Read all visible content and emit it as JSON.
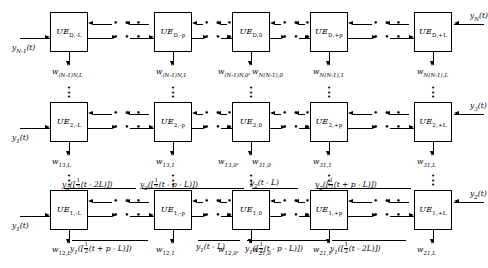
{
  "diagram": {
    "rows": [
      {
        "id": "row-D",
        "boxes": [
          {
            "name": "UE",
            "sub": "D,-L"
          },
          {
            "name": "UE",
            "sub": "D,-p"
          },
          {
            "name": "UE",
            "sub": "D,0"
          },
          {
            "name": "UE",
            "sub": "D,+p"
          },
          {
            "name": "UE",
            "sub": "D,+L"
          }
        ],
        "left_input": "y_{N-1}(t)",
        "left_input_parts": {
          "base": "y",
          "sub": "N-1",
          "tail": "(t)"
        },
        "right_input_parts": {
          "base": "y",
          "sub": "N",
          "tail": "(t)"
        },
        "weights": [
          {
            "base": "w",
            "sub": "(N-1)N,L"
          },
          {
            "base": "w",
            "sub": "(N-1)N,1"
          },
          {
            "base": "w",
            "sub": "(N-1)N,0"
          },
          {
            "base": "w",
            "sub": "N(N-1),0"
          },
          {
            "base": "w",
            "sub": "N(N-1),1"
          },
          {
            "base": "w",
            "sub": "N(N-1),L"
          }
        ]
      },
      {
        "id": "row-2",
        "boxes": [
          {
            "name": "UE",
            "sub": "2,-L"
          },
          {
            "name": "UE",
            "sub": "2,-p"
          },
          {
            "name": "UE",
            "sub": "2,0"
          },
          {
            "name": "UE",
            "sub": "2,+p"
          },
          {
            "name": "UE",
            "sub": "2,+L"
          }
        ],
        "left_input_parts": {
          "base": "y",
          "sub": "1",
          "tail": "(t)"
        },
        "right_input_parts": {
          "base": "y",
          "sub": "3",
          "tail": "(t)"
        },
        "weights": [
          {
            "base": "w",
            "sub": "13,L"
          },
          {
            "base": "w",
            "sub": "13,1"
          },
          {
            "base": "w",
            "sub": "13,0"
          },
          {
            "base": "w",
            "sub": "31,0"
          },
          {
            "base": "w",
            "sub": "31,1"
          },
          {
            "base": "w",
            "sub": "31,L"
          }
        ]
      },
      {
        "id": "row-1",
        "boxes": [
          {
            "name": "UE",
            "sub": "1,-L"
          },
          {
            "name": "UE",
            "sub": "1,-p"
          },
          {
            "name": "UE",
            "sub": "1,0"
          },
          {
            "name": "UE",
            "sub": "1,+p"
          },
          {
            "name": "UE",
            "sub": "1,+L"
          }
        ],
        "left_input_parts": {
          "base": "y",
          "sub": "1",
          "tail": "(t)"
        },
        "right_input_parts": {
          "base": "y",
          "sub": "2",
          "tail": "(t)"
        },
        "weights": [
          {
            "base": "w",
            "sub": "12,L"
          },
          {
            "base": "w",
            "sub": "12,1"
          },
          {
            "base": "w",
            "sub": "12,0"
          },
          {
            "base": "w",
            "sub": "21,0"
          },
          {
            "base": "w",
            "sub": "21,1"
          },
          {
            "base": "w",
            "sub": "21,L"
          }
        ],
        "top_signals": [
          {
            "base": "y",
            "sub": "2",
            "open": "([",
            "arg": "(t - 2L)",
            "close": "])",
            "frac": true
          },
          {
            "base": "y",
            "sub": "2",
            "open": "([",
            "arg": "(t - p - L)",
            "close": "])",
            "frac": true
          },
          {
            "base": "y",
            "sub": "2",
            "open": "(",
            "arg": "t - L",
            "close": ")",
            "frac": false
          },
          {
            "base": "y",
            "sub": "2",
            "open": "([",
            "arg": "(t + p - L)",
            "close": "])",
            "frac": true
          }
        ],
        "bottom_signals": [
          {
            "base": "y",
            "sub": "1",
            "open": "([",
            "arg": "(t + p - L)",
            "close": "])",
            "frac": true
          },
          {
            "base": "y",
            "sub": "1",
            "open": "(",
            "arg": "t - L",
            "close": ")",
            "frac": false
          },
          {
            "base": "y",
            "sub": "1",
            "open": "([",
            "arg": "(t - p - L)",
            "close": "])",
            "frac": true
          },
          {
            "base": "y",
            "sub": "1",
            "open": "([",
            "arg": "(t - 2L)",
            "close": "])",
            "frac": true
          }
        ]
      }
    ],
    "ellipsis": "• • •",
    "vertical_ellipsis": "•",
    "fraction": {
      "numerator": "1",
      "denominator": "2"
    }
  }
}
